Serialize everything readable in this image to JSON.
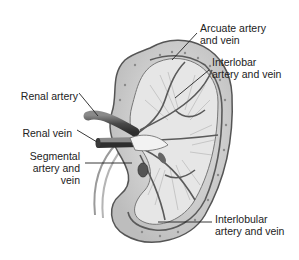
{
  "diagram": {
    "colors": {
      "background": "#ffffff",
      "ink": "#222222",
      "tissue": "#cfcfcf",
      "vessel": "#5a5a5a"
    },
    "labels": [
      {
        "id": "arcuate",
        "text": "Arcuate artery\nand vein"
      },
      {
        "id": "interlobar",
        "text": "Interlobar\nartery and vein"
      },
      {
        "id": "renal_artery",
        "text": "Renal artery"
      },
      {
        "id": "renal_vein",
        "text": "Renal vein"
      },
      {
        "id": "segmental",
        "text": "Segmental\nartery and\nvein"
      },
      {
        "id": "interlobular",
        "text": "Interlobular\nartery and vein"
      }
    ]
  }
}
